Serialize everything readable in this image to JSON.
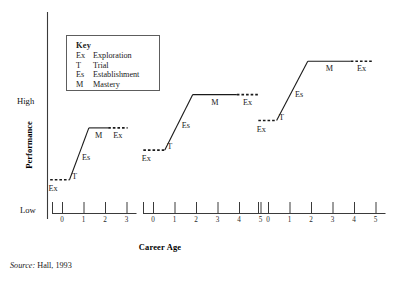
{
  "figure": {
    "source_note_prefix": "Source:",
    "source_note_text": " Hall, 1993"
  },
  "key": {
    "title": "Key",
    "entries": [
      {
        "abbr": "Ex",
        "name": "Exploration"
      },
      {
        "abbr": "T",
        "name": "Trial"
      },
      {
        "abbr": "Es",
        "name": "Establishment"
      },
      {
        "abbr": "M",
        "name": "Mastery"
      }
    ]
  },
  "chart_data": {
    "type": "line",
    "title": "",
    "xlabel": "Career Age",
    "ylabel": "Performance",
    "ylim": [
      0,
      1
    ],
    "y_tick_labels": [
      "High",
      "Low"
    ],
    "grid": false,
    "legend": "inset-key-box",
    "annotation_labels": [
      "Ex",
      "T",
      "Es",
      "M",
      "Ex"
    ],
    "axes": [
      {
        "index": 1,
        "x_ticks": [
          0,
          1,
          2,
          3
        ],
        "tick_labels": [
          "0",
          "1",
          "2",
          "3"
        ],
        "plateau_level": "low",
        "segments": [
          {
            "stage": "Ex",
            "style": "dashed",
            "x_start": -0.55,
            "x_end": 0.35,
            "y_start": 0.18,
            "y_end": 0.18
          },
          {
            "stage": "T",
            "style": "solid",
            "x_start": 0.35,
            "x_end": 1.25,
            "y_start": 0.18,
            "y_end": 0.46
          },
          {
            "stage": "M",
            "style": "solid",
            "x_start": 1.25,
            "x_end": 2.15,
            "y_start": 0.46,
            "y_end": 0.46
          },
          {
            "stage": "Ex",
            "style": "dashed",
            "x_start": 2.15,
            "x_end": 3.05,
            "y_start": 0.46,
            "y_end": 0.46
          }
        ]
      },
      {
        "index": 2,
        "x_ticks": [
          0,
          1,
          2,
          3,
          4,
          5
        ],
        "tick_labels": [
          "0",
          "1",
          "2",
          "3",
          "4",
          "5"
        ],
        "plateau_level": "mid",
        "segments": [
          {
            "stage": "Ex",
            "style": "dashed",
            "x_start": -0.45,
            "x_end": 0.55,
            "y_start": 0.34,
            "y_end": 0.34
          },
          {
            "stage": "T",
            "style": "solid",
            "x_start": 0.55,
            "x_end": 1.85,
            "y_start": 0.34,
            "y_end": 0.64
          },
          {
            "stage": "M",
            "style": "solid",
            "x_start": 1.85,
            "x_end": 3.9,
            "y_start": 0.64,
            "y_end": 0.64
          },
          {
            "stage": "Ex",
            "style": "dashed",
            "x_start": 3.9,
            "x_end": 4.9,
            "y_start": 0.64,
            "y_end": 0.64
          }
        ]
      },
      {
        "index": 3,
        "x_ticks": [
          0,
          1,
          2,
          3,
          4,
          5
        ],
        "tick_labels": [
          "0",
          "1",
          "2",
          "3",
          "4",
          "5"
        ],
        "plateau_level": "high",
        "segments": [
          {
            "stage": "Ex",
            "style": "dashed",
            "x_start": -0.45,
            "x_end": 0.4,
            "y_start": 0.5,
            "y_end": 0.5
          },
          {
            "stage": "T",
            "style": "solid",
            "x_start": 0.4,
            "x_end": 1.85,
            "y_start": 0.5,
            "y_end": 0.82
          },
          {
            "stage": "M",
            "style": "solid",
            "x_start": 1.85,
            "x_end": 3.85,
            "y_start": 0.82,
            "y_end": 0.82
          },
          {
            "stage": "Ex",
            "style": "dashed",
            "x_start": 3.85,
            "x_end": 4.85,
            "y_start": 0.82,
            "y_end": 0.82
          }
        ]
      }
    ]
  }
}
